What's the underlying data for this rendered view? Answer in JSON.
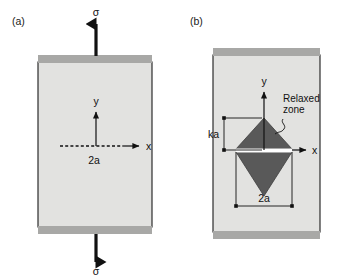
{
  "figure": {
    "width": 341,
    "height": 278,
    "background": "#ffffff"
  },
  "colors": {
    "plate_fill": "#e2e2e0",
    "grip_fill": "#a8a8a6",
    "plate_stroke": "#1a1a1a",
    "relaxed_zone_fill": "#595959",
    "relaxed_zone_stroke": "#3d3d3d",
    "crack_gap": "#ffffff",
    "ink": "#111111"
  },
  "panels": [
    {
      "id": "a",
      "label": "(a)",
      "plate": {
        "x": 38,
        "y": 62,
        "width": 114,
        "height": 165
      },
      "grip_band_height": 8,
      "origin": {
        "x": 96,
        "y": 146
      },
      "axes": {
        "y_label": "y",
        "x_label": "x",
        "y_arrow_length": 38,
        "x_arrow_length": 44
      },
      "crack": {
        "style": "dashed",
        "half_length_label": "2a",
        "x_start": 60,
        "x_end": 123,
        "y": 146
      },
      "loads": [
        {
          "name": "top-stress",
          "symbol": "σ",
          "direction": "up",
          "label_x": 96,
          "label_y": 14,
          "arrow_x": 96,
          "arrow_tail_y": 56,
          "arrow_head_y": 20
        },
        {
          "name": "bottom-stress",
          "symbol": "σ",
          "direction": "down",
          "label_x": 96,
          "label_y": 274,
          "arrow_x": 96,
          "arrow_tail_y": 233,
          "arrow_head_y": 266
        }
      ]
    },
    {
      "id": "b",
      "label": "(b)",
      "plate": {
        "x": 213,
        "y": 55,
        "width": 107,
        "height": 177
      },
      "grip_band_height": 8,
      "origin": {
        "x": 264,
        "y": 150
      },
      "axes": {
        "y_label": "y",
        "x_label": "x",
        "y_arrow_length": 58,
        "x_arrow_length": 43
      },
      "relaxed_zone": {
        "label_line_1": "Relaxed",
        "label_line_2": "zone",
        "half_width": 28,
        "top_vertex_y": 118,
        "bottom_vertex_y": 196,
        "gap_top_y": 147,
        "gap_bottom_y": 152,
        "center_x": 264
      },
      "dimensions": [
        {
          "name": "ka",
          "label": "ka",
          "orientation": "vertical",
          "x": 224,
          "y_top": 118,
          "y_bottom": 150,
          "label_x": 216,
          "label_y": 137
        },
        {
          "name": "2a",
          "label": "2a",
          "orientation": "horizontal",
          "y": 202,
          "x_left": 236,
          "x_right": 292,
          "label_x": 264,
          "label_y": 200
        }
      ]
    }
  ]
}
